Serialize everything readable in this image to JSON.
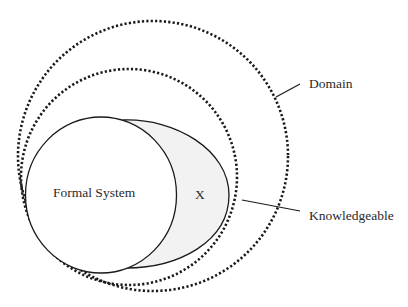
{
  "diagram": {
    "type": "nested-set-diagram",
    "regions": {
      "domain": {
        "label": "Domain",
        "style": "dotted",
        "stroke": "#1a1a1a"
      },
      "knowledgeable": {
        "label": "Knowledgeable",
        "style": "dotted",
        "stroke": "#1a1a1a"
      },
      "formal_system": {
        "label": "Formal System",
        "style": "solid",
        "fill": "#ffffff",
        "stroke": "#1a1a1a"
      },
      "x_region": {
        "label": "X",
        "style": "solid",
        "fill": "#f2f2f2",
        "stroke": "#1a1a1a"
      }
    },
    "colors": {
      "background": "#ffffff",
      "line": "#1a1a1a",
      "shaded": "#f2f2f2",
      "text": "#2a2a2a"
    }
  }
}
